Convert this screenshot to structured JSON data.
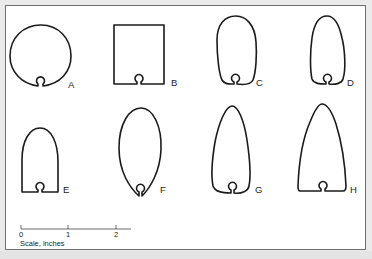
{
  "figure": {
    "shapes": [
      {
        "id": "A",
        "label": "A",
        "form": "circle"
      },
      {
        "id": "B",
        "label": "B",
        "form": "rectangle"
      },
      {
        "id": "C",
        "label": "C",
        "form": "pear/oval with narrow base"
      },
      {
        "id": "D",
        "label": "D",
        "form": "egg tapered top"
      },
      {
        "id": "E",
        "label": "E",
        "form": "arch with flat base"
      },
      {
        "id": "F",
        "label": "F",
        "form": "ellipse pointed bottom"
      },
      {
        "id": "G",
        "label": "G",
        "form": "tall tapered teardrop"
      },
      {
        "id": "H",
        "label": "H",
        "form": "tall arch/bullet with flat flared base"
      }
    ],
    "scale": {
      "ticks": [
        "0",
        "1",
        "2"
      ],
      "caption": "Scale, inches"
    }
  },
  "colors": {
    "stroke": "#1a1a1a",
    "background": "#ffffff",
    "frame_border": "#6e6e6e",
    "page_background": "#ebebeb"
  }
}
